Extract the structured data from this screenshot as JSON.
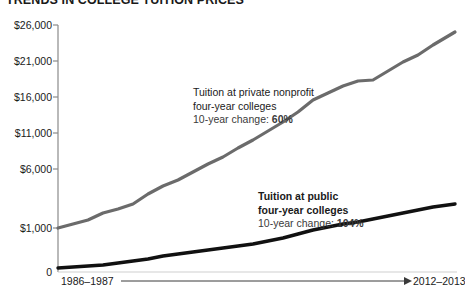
{
  "title": "TRENDS IN COLLEGE TUITION PRICES",
  "axes": {
    "y_ticks": [
      "$26,000",
      "$21,000",
      "$16,000",
      "$11,000",
      "$6,000",
      "$1,000",
      "0"
    ],
    "x_start_label": "1986–1987",
    "x_end_label": "2012–2013"
  },
  "annotations": {
    "private": {
      "line1": "Tuition at private nonprofit",
      "line2": "four-year colleges",
      "change_prefix": "10-year change: ",
      "change_value": "60%"
    },
    "public": {
      "line1": "Tuition at public",
      "line2": "four-year colleges",
      "change_prefix": "10-year change: ",
      "change_value": "104%"
    }
  },
  "colors": {
    "private_line": "#6b6b6b",
    "public_line": "#111111",
    "axis": "#8a8a8a",
    "text": "#1a1a1a"
  },
  "chart_data": {
    "type": "line",
    "title": "TRENDS IN COLLEGE TUITION PRICES",
    "xlabel": "",
    "ylabel": "",
    "ylim": [
      0,
      26000
    ],
    "yticks": [
      0,
      1000,
      6000,
      11000,
      16000,
      21000,
      26000
    ],
    "ytick_labels": [
      "0",
      "$1,000",
      "$6,000",
      "$11,000",
      "$16,000",
      "$21,000",
      "$26,000"
    ],
    "grid": false,
    "legend": "annotations-inline",
    "x": [
      "1986-1987",
      "1987-1988",
      "1988-1989",
      "1989-1990",
      "1990-1991",
      "1991-1992",
      "1992-1993",
      "1993-1994",
      "1994-1995",
      "1995-1996",
      "1996-1997",
      "1997-1998",
      "1998-1999",
      "1999-2000",
      "2000-2001",
      "2001-2002",
      "2002-2003",
      "2003-2004",
      "2004-2005",
      "2005-2006",
      "2006-2007",
      "2007-2008",
      "2008-2009",
      "2009-2010",
      "2010-2011",
      "2011-2012",
      "2012-2013"
    ],
    "series": [
      {
        "name": "Tuition at private nonprofit four-year colleges",
        "color": "#6b6b6b",
        "ten_year_change": "60%",
        "values": [
          1700,
          2100,
          2500,
          3000,
          3400,
          3700,
          4300,
          5000,
          5600,
          6300,
          7000,
          7700,
          8500,
          9300,
          10100,
          11000,
          12100,
          13500,
          14600,
          15600,
          16500,
          17700,
          18800,
          19700,
          20300,
          21400,
          22600
        ]
      },
      {
        "name": "Tuition at public four-year colleges",
        "color": "#111111",
        "ten_year_change": "104%",
        "values": [
          300,
          400,
          500,
          600,
          700,
          850,
          1000,
          1200,
          1350,
          1450,
          1550,
          1700,
          1800,
          1900,
          2000,
          2150,
          2350,
          2600,
          2900,
          3100,
          3300,
          3500,
          3700,
          4000,
          4300,
          4600,
          4900
        ]
      }
    ]
  },
  "geometry": {
    "plot": {
      "left": 58,
      "right": 457,
      "top": 25,
      "bottom": 272
    },
    "private_points": "58,228 73,224 88,220 103,213 118,209 133,204 148,194 163,186 178,180 193,172 208,164 223,157 238,148 253,140 268,131 283,122 298,112 313,100 328,93 343,86 358,81 373,80 388,71 403,62 418,55 433,45 455,32",
    "public_points": "58,268 73,267 88,266 103,265 118,263 133,261 148,259 163,256 178,254 193,252 208,250 223,248 238,246 253,244 268,241 283,238 298,234 313,230 328,227 343,224 358,222 373,219 388,216 403,213 418,210 433,207 455,204"
  }
}
